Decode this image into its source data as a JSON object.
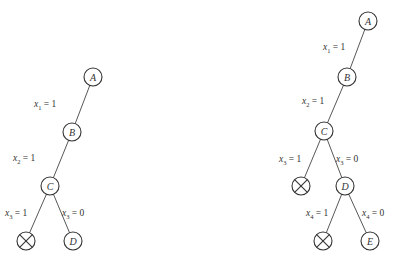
{
  "diagram": {
    "type": "binary-decision-tree",
    "trees": [
      {
        "id": "left",
        "nodes": [
          {
            "id": "A",
            "label": "A",
            "x": 93,
            "y": 77,
            "kind": "node"
          },
          {
            "id": "B",
            "label": "B",
            "x": 72,
            "y": 132,
            "kind": "node"
          },
          {
            "id": "C",
            "label": "C",
            "x": 50,
            "y": 186,
            "kind": "node"
          },
          {
            "id": "X1",
            "label": "",
            "x": 26,
            "y": 241,
            "kind": "pruned"
          },
          {
            "id": "D",
            "label": "D",
            "x": 73,
            "y": 241,
            "kind": "node"
          }
        ],
        "edges": [
          {
            "from": "A",
            "to": "B",
            "var": "x",
            "sub": "1",
            "val": "1",
            "lx": 34,
            "ly": 107
          },
          {
            "from": "B",
            "to": "C",
            "var": "x",
            "sub": "2",
            "val": "1",
            "lx": 13,
            "ly": 161
          },
          {
            "from": "C",
            "to": "X1",
            "var": "x",
            "sub": "3",
            "val": "1",
            "lx": 5,
            "ly": 216
          },
          {
            "from": "C",
            "to": "D",
            "var": "x",
            "sub": "3",
            "val": "0",
            "lx": 62,
            "ly": 216
          }
        ]
      },
      {
        "id": "right",
        "nodes": [
          {
            "id": "A",
            "label": "A",
            "x": 368,
            "y": 21,
            "kind": "node"
          },
          {
            "id": "B",
            "label": "B",
            "x": 347,
            "y": 77,
            "kind": "node"
          },
          {
            "id": "C",
            "label": "C",
            "x": 324,
            "y": 131,
            "kind": "node"
          },
          {
            "id": "X1",
            "label": "",
            "x": 301,
            "y": 186,
            "kind": "pruned"
          },
          {
            "id": "D",
            "label": "D",
            "x": 345,
            "y": 186,
            "kind": "node"
          },
          {
            "id": "X2",
            "label": "",
            "x": 323,
            "y": 241,
            "kind": "pruned"
          },
          {
            "id": "E",
            "label": "E",
            "x": 370,
            "y": 241,
            "kind": "node"
          }
        ],
        "edges": [
          {
            "from": "A",
            "to": "B",
            "var": "x",
            "sub": "1",
            "val": "1",
            "lx": 323,
            "ly": 50
          },
          {
            "from": "B",
            "to": "C",
            "var": "x",
            "sub": "2",
            "val": "1",
            "lx": 302,
            "ly": 104
          },
          {
            "from": "C",
            "to": "X1",
            "var": "x",
            "sub": "3",
            "val": "1",
            "lx": 279,
            "ly": 162
          },
          {
            "from": "C",
            "to": "D",
            "var": "x",
            "sub": "3",
            "val": "0",
            "lx": 336,
            "ly": 162
          },
          {
            "from": "D",
            "to": "X2",
            "var": "x",
            "sub": "4",
            "val": "1",
            "lx": 306,
            "ly": 216
          },
          {
            "from": "D",
            "to": "E",
            "var": "x",
            "sub": "4",
            "val": "0",
            "lx": 362,
            "ly": 216
          }
        ]
      }
    ]
  },
  "style": {
    "stroke": "#333333",
    "background": "#ffffff",
    "node_radius": 9
  }
}
